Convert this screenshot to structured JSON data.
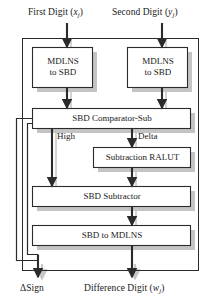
{
  "diagram": {
    "type": "block-diagram",
    "colors": {
      "stroke": "#2b2b2b",
      "box_fill": "#ffffff",
      "shadow": "#bdbdbd",
      "text": "#1a1a1a",
      "background": "#ffffff"
    },
    "inputs": [
      {
        "id": "first-digit",
        "label": "First Digit (",
        "var": "x",
        "sub": "j",
        "tail": ")"
      },
      {
        "id": "second-digit",
        "label": "Second Digit (",
        "var": "y",
        "sub": "j",
        "tail": ")"
      }
    ],
    "blocks": [
      {
        "id": "mdlns-to-sbd-left",
        "line1": "MDLNS",
        "line2": "to SBD"
      },
      {
        "id": "mdlns-to-sbd-right",
        "line1": "MDLNS",
        "line2": "to SBD"
      },
      {
        "id": "sbd-comparator-sub",
        "line1": "SBD Comparator-Sub",
        "line2": ""
      },
      {
        "id": "subtraction-ralut",
        "line1": "Subtraction RALUT",
        "line2": ""
      },
      {
        "id": "sbd-subtractor",
        "line1": "SBD Subtractor",
        "line2": ""
      },
      {
        "id": "sbd-to-mdlns",
        "line1": "SBD to MDLNS",
        "line2": ""
      }
    ],
    "signals": [
      {
        "id": "high",
        "label": "High"
      },
      {
        "id": "delta",
        "label": "Delta"
      }
    ],
    "outputs": [
      {
        "id": "delta-sign",
        "label": "ΔSign",
        "var": "",
        "sub": "",
        "tail": ""
      },
      {
        "id": "difference-digit",
        "label": "Difference Digit (",
        "var": "w",
        "sub": "j",
        "tail": ")"
      }
    ]
  }
}
